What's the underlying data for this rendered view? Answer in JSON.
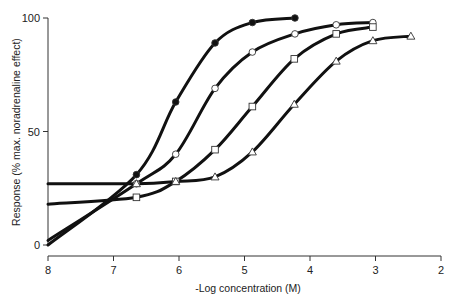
{
  "chart_data": {
    "type": "line",
    "title": "",
    "xlabel": "-Log concentration (M)",
    "ylabel": "Response (% max. noradrenaline effect)",
    "xlim": [
      8,
      2
    ],
    "ylim": [
      0,
      100
    ],
    "x_reversed": true,
    "grid": false,
    "legend": null,
    "x_ticks": [
      8,
      7,
      6,
      5,
      4,
      3,
      2
    ],
    "y_ticks": [
      0,
      50,
      100
    ],
    "series": [
      {
        "name": "filled-circle",
        "marker": "filled-circle",
        "curve_start": {
          "x": 8.0,
          "y": 0
        },
        "points": [
          {
            "x": 6.65,
            "y": 31
          },
          {
            "x": 6.05,
            "y": 63
          },
          {
            "x": 5.45,
            "y": 89
          },
          {
            "x": 4.88,
            "y": 98
          },
          {
            "x": 4.23,
            "y": 100
          }
        ]
      },
      {
        "name": "open-circle",
        "marker": "open-circle",
        "curve_start": {
          "x": 8.0,
          "y": 2
        },
        "points": [
          {
            "x": 6.65,
            "y": 27
          },
          {
            "x": 6.05,
            "y": 40
          },
          {
            "x": 5.45,
            "y": 69
          },
          {
            "x": 4.88,
            "y": 85
          },
          {
            "x": 4.23,
            "y": 93
          },
          {
            "x": 3.6,
            "y": 97
          },
          {
            "x": 3.04,
            "y": 98
          }
        ]
      },
      {
        "name": "open-square",
        "marker": "open-square",
        "curve_start": {
          "x": 8.0,
          "y": 18
        },
        "points": [
          {
            "x": 6.65,
            "y": 21
          },
          {
            "x": 6.05,
            "y": 28
          },
          {
            "x": 5.45,
            "y": 42
          },
          {
            "x": 4.88,
            "y": 61
          },
          {
            "x": 4.24,
            "y": 82
          },
          {
            "x": 3.6,
            "y": 93
          },
          {
            "x": 3.04,
            "y": 96
          }
        ]
      },
      {
        "name": "open-triangle",
        "marker": "open-triangle",
        "curve_start": {
          "x": 8.0,
          "y": 27
        },
        "points": [
          {
            "x": 6.65,
            "y": 27
          },
          {
            "x": 6.05,
            "y": 28
          },
          {
            "x": 5.45,
            "y": 30
          },
          {
            "x": 4.88,
            "y": 41
          },
          {
            "x": 4.24,
            "y": 62
          },
          {
            "x": 3.6,
            "y": 81
          },
          {
            "x": 3.04,
            "y": 90
          },
          {
            "x": 2.46,
            "y": 92
          }
        ]
      }
    ]
  },
  "axes": {
    "x_label_prefix": "-",
    "x_label_text": "Log concentration (M)",
    "y_label": "Response (% max. noradrenaline effect)",
    "x_tick_labels": [
      "8",
      "7",
      "6",
      "5",
      "4",
      "3",
      "2"
    ],
    "y_tick_labels": [
      "0",
      "50",
      "100"
    ]
  }
}
